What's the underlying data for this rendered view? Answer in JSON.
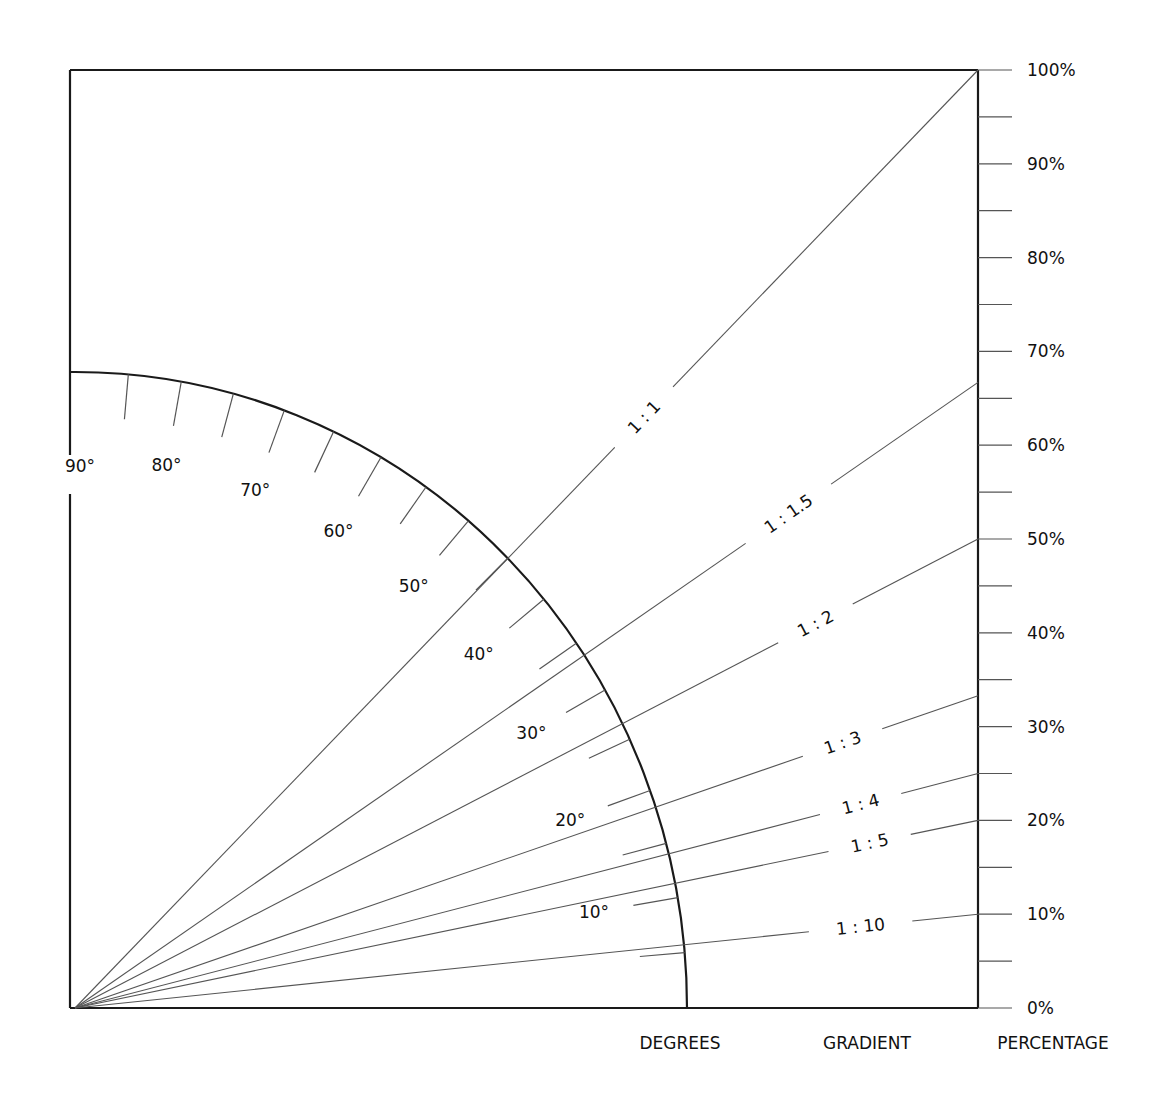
{
  "diagram": {
    "axis_titles": {
      "degrees": "DEGREES",
      "gradient": "GRADIENT",
      "percentage": "PERCENTAGE"
    },
    "degree_labels": [
      "10°",
      "20°",
      "30°",
      "40°",
      "50°",
      "60°",
      "70°",
      "80°",
      "90°"
    ],
    "degree_tick_step": 5,
    "percentage_labels": [
      "0%",
      "10%",
      "20%",
      "30%",
      "40%",
      "50%",
      "60%",
      "70%",
      "80%",
      "90%",
      "100%"
    ],
    "percentage_tick_step": 5,
    "gradients": [
      {
        "label": "1 : 1",
        "rise": 1,
        "run": 1,
        "percent": 100
      },
      {
        "label": "1 : 1.5",
        "rise": 1,
        "run": 1.5,
        "percent": 66.7
      },
      {
        "label": "1 : 2",
        "rise": 1,
        "run": 2,
        "percent": 50
      },
      {
        "label": "1 : 3",
        "rise": 1,
        "run": 3,
        "percent": 33.3
      },
      {
        "label": "1 : 4",
        "rise": 1,
        "run": 4,
        "percent": 25
      },
      {
        "label": "1 : 5",
        "rise": 1,
        "run": 5,
        "percent": 20
      },
      {
        "label": "1 : 10",
        "rise": 1,
        "run": 10,
        "percent": 10
      }
    ],
    "colors": {
      "frame": "#1a1a1a",
      "line": "#555555",
      "text": "#111111",
      "background": "#ffffff"
    }
  }
}
